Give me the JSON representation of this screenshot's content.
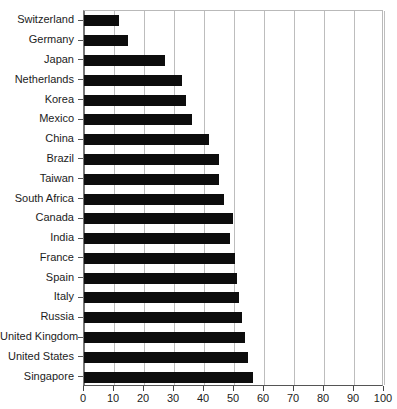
{
  "chart_data": {
    "type": "bar",
    "orientation": "horizontal",
    "title": "",
    "xlabel": "",
    "ylabel": "",
    "xlim": [
      0,
      100
    ],
    "xticks": [
      0,
      10,
      20,
      30,
      40,
      50,
      60,
      70,
      80,
      90,
      100
    ],
    "grid": true,
    "legend": null,
    "bar_color": "#0d0d0d",
    "grid_color": "#bdbdbd",
    "axis_color": "#555555",
    "categories": [
      "Switzerland",
      "Germany",
      "Japan",
      "Netherlands",
      "Korea",
      "Mexico",
      "China",
      "Brazil",
      "Taiwan",
      "South Africa",
      "Canada",
      "India",
      "France",
      "Spain",
      "Italy",
      "Russia",
      "United Kingdom",
      "United States",
      "Singapore"
    ],
    "values": [
      11.5,
      14.5,
      27,
      32.5,
      34,
      36,
      41.5,
      45,
      45,
      46.5,
      49.5,
      48.7,
      50.3,
      51,
      51.7,
      52.7,
      53.7,
      54.5,
      56.3
    ]
  }
}
